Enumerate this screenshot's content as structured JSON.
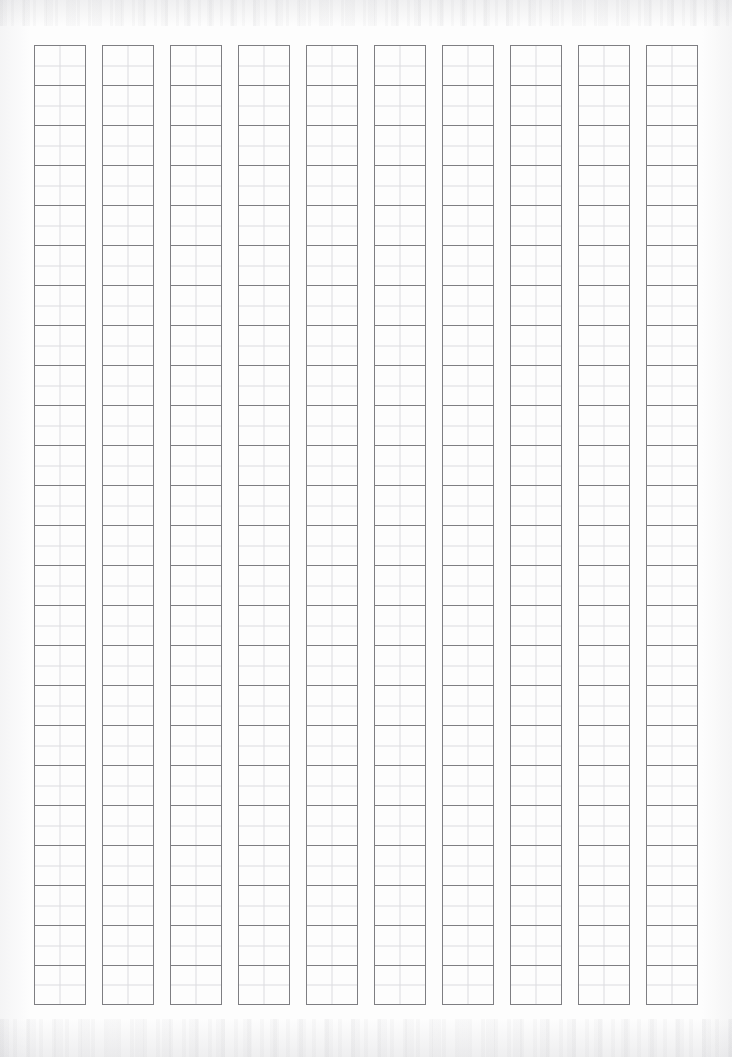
{
  "page": {
    "kind": "japanese-manuscript-paper",
    "state": "blank",
    "background_color": "#fdfdfd",
    "width_px": 732,
    "height_px": 1057
  },
  "grid": {
    "columns": 10,
    "cells_per_column": 24,
    "total_cells": 240,
    "writing_direction": "vertical-right-to-left",
    "cell_width_px": 52,
    "cell_height_px": 40,
    "column_gap_px": 16,
    "origin_x_px": 34,
    "origin_y_px": 45,
    "frame_line_color": "#7e7e82",
    "guide_line_color": "#dcdcdf",
    "frame_line_width_px": 1,
    "guide_line_width_px": 1,
    "quadrant_guides": true,
    "column_labels": [
      "column-1",
      "column-2",
      "column-3",
      "column-4",
      "column-5",
      "column-6",
      "column-7",
      "column-8",
      "column-9",
      "column-10"
    ],
    "cell_contents": [
      [
        "",
        "",
        "",
        "",
        "",
        "",
        "",
        "",
        "",
        "",
        "",
        "",
        "",
        "",
        "",
        "",
        "",
        "",
        "",
        "",
        "",
        "",
        "",
        ""
      ],
      [
        "",
        "",
        "",
        "",
        "",
        "",
        "",
        "",
        "",
        "",
        "",
        "",
        "",
        "",
        "",
        "",
        "",
        "",
        "",
        "",
        "",
        "",
        "",
        ""
      ],
      [
        "",
        "",
        "",
        "",
        "",
        "",
        "",
        "",
        "",
        "",
        "",
        "",
        "",
        "",
        "",
        "",
        "",
        "",
        "",
        "",
        "",
        "",
        "",
        ""
      ],
      [
        "",
        "",
        "",
        "",
        "",
        "",
        "",
        "",
        "",
        "",
        "",
        "",
        "",
        "",
        "",
        "",
        "",
        "",
        "",
        "",
        "",
        "",
        "",
        ""
      ],
      [
        "",
        "",
        "",
        "",
        "",
        "",
        "",
        "",
        "",
        "",
        "",
        "",
        "",
        "",
        "",
        "",
        "",
        "",
        "",
        "",
        "",
        "",
        "",
        ""
      ],
      [
        "",
        "",
        "",
        "",
        "",
        "",
        "",
        "",
        "",
        "",
        "",
        "",
        "",
        "",
        "",
        "",
        "",
        "",
        "",
        "",
        "",
        "",
        "",
        ""
      ],
      [
        "",
        "",
        "",
        "",
        "",
        "",
        "",
        "",
        "",
        "",
        "",
        "",
        "",
        "",
        "",
        "",
        "",
        "",
        "",
        "",
        "",
        "",
        "",
        ""
      ],
      [
        "",
        "",
        "",
        "",
        "",
        "",
        "",
        "",
        "",
        "",
        "",
        "",
        "",
        "",
        "",
        "",
        "",
        "",
        "",
        "",
        "",
        "",
        "",
        ""
      ],
      [
        "",
        "",
        "",
        "",
        "",
        "",
        "",
        "",
        "",
        "",
        "",
        "",
        "",
        "",
        "",
        "",
        "",
        "",
        "",
        "",
        "",
        "",
        "",
        ""
      ],
      [
        "",
        "",
        "",
        "",
        "",
        "",
        "",
        "",
        "",
        "",
        "",
        "",
        "",
        "",
        "",
        "",
        "",
        "",
        "",
        "",
        "",
        "",
        "",
        ""
      ]
    ]
  },
  "artifacts": {
    "top_noise_band": true,
    "bottom_noise_band": true,
    "left_edge_shading": true,
    "right_edge_shading": true
  }
}
